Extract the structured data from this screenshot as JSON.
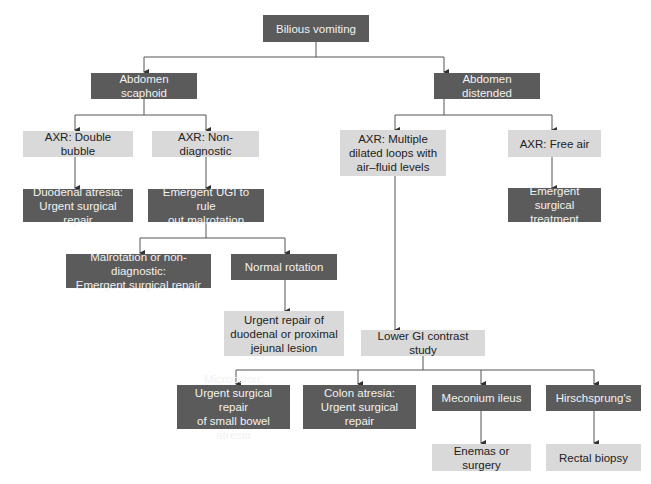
{
  "diagram": {
    "type": "flowchart",
    "colors": {
      "dark_box": "#5b5b5b",
      "dark_text": "#f2f2f2",
      "light_box": "#d9d9d9",
      "light_text": "#222222",
      "line": "#444444"
    },
    "nodes": {
      "root": "Bilious vomiting",
      "scaphoid": "Abdomen scaphoid",
      "distended": "Abdomen distended",
      "double_bubble": "AXR: Double bubble",
      "non_diagnostic": "AXR: Non-diagnostic",
      "multiple_loops": "AXR: Multiple\ndilated loops with\nair–fluid levels",
      "free_air": "AXR: Free air",
      "duodenal_atresia": "Duodenal atresia:\nUrgent surgical repair",
      "emergent_ugi": "Emergent UGI to rule\nout malrotation",
      "emergent_surgical_treatment": "Emergent surgical\ntreatment",
      "malrotation": "Malrotation or non-diagnostic:\nEmergent surgical repair",
      "normal_rotation": "Normal rotation",
      "urgent_repair_duodenal": "Urgent repair of\nduodenal or proximal\njejunal lesion",
      "lower_gi": "Lower GI contrast study",
      "microcolon": "Microcolon:\nUrgent surgical repair\nof small bowel atresia",
      "colon_atresia": "Colon atresia:\nUrgent surgical repair",
      "meconium_ileus": "Meconium ileus",
      "hirschsprungs": "Hirschsprung's",
      "enemas": "Enemas or surgery",
      "rectal_biopsy": "Rectal biopsy"
    },
    "edges": [
      [
        "root",
        "scaphoid"
      ],
      [
        "root",
        "distended"
      ],
      [
        "scaphoid",
        "double_bubble"
      ],
      [
        "scaphoid",
        "non_diagnostic"
      ],
      [
        "distended",
        "multiple_loops"
      ],
      [
        "distended",
        "free_air"
      ],
      [
        "double_bubble",
        "duodenal_atresia"
      ],
      [
        "non_diagnostic",
        "emergent_ugi"
      ],
      [
        "free_air",
        "emergent_surgical_treatment"
      ],
      [
        "emergent_ugi",
        "malrotation"
      ],
      [
        "emergent_ugi",
        "normal_rotation"
      ],
      [
        "normal_rotation",
        "urgent_repair_duodenal"
      ],
      [
        "multiple_loops",
        "lower_gi"
      ],
      [
        "lower_gi",
        "microcolon"
      ],
      [
        "lower_gi",
        "colon_atresia"
      ],
      [
        "lower_gi",
        "meconium_ileus"
      ],
      [
        "lower_gi",
        "hirschsprungs"
      ],
      [
        "meconium_ileus",
        "enemas"
      ],
      [
        "hirschsprungs",
        "rectal_biopsy"
      ]
    ]
  }
}
